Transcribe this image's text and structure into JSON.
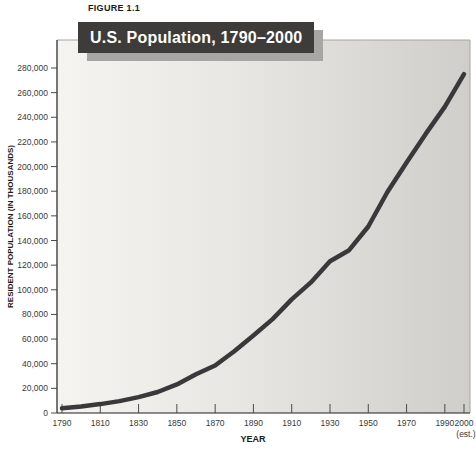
{
  "figure": {
    "label": "FIGURE 1.1"
  },
  "title_bar": {
    "text": "U.S. Population, 1790–2000"
  },
  "chart_data": {
    "type": "line",
    "title": "U.S. Population, 1790–2000",
    "xlabel": "YEAR",
    "ylabel": "RESIDENT POPULATION (IN THOUSANDS)",
    "x": [
      1790,
      1800,
      1810,
      1820,
      1830,
      1840,
      1850,
      1860,
      1870,
      1880,
      1890,
      1900,
      1910,
      1920,
      1930,
      1940,
      1950,
      1960,
      1970,
      1980,
      1990,
      2000
    ],
    "values": [
      3929,
      5308,
      7240,
      9638,
      12866,
      17069,
      23192,
      31443,
      38558,
      50189,
      62980,
      76212,
      92228,
      106021,
      123202,
      132164,
      151325,
      179323,
      203302,
      226542,
      248710,
      275000
    ],
    "series_name": "U.S. resident population (thousands)",
    "xlim": [
      1790,
      2000
    ],
    "ylim": [
      0,
      280000
    ],
    "ytick_step": 20000,
    "xticks": [
      1790,
      1810,
      1830,
      1850,
      1870,
      1890,
      1910,
      1930,
      1950,
      1970,
      1990,
      2000
    ],
    "last_xtick_note": "(est.)",
    "grid": false,
    "legend": "none",
    "line_color": "#39393b",
    "plot_bg_left": "#f5f4f1",
    "plot_bg_mid": "#e7e6e3",
    "plot_bg_right": "#cfcecb"
  },
  "colors": {
    "page_bg": "#ffffff",
    "title_bar_bg": "#3d3c3a",
    "title_bar_text": "#ffffff",
    "title_bar_shadow": "#a7a6a3",
    "axis_dark": "#1f1f1f",
    "axis_light": "#a5a4a1",
    "tick": "#4a4a48",
    "tick_label": "#3a3a38"
  }
}
